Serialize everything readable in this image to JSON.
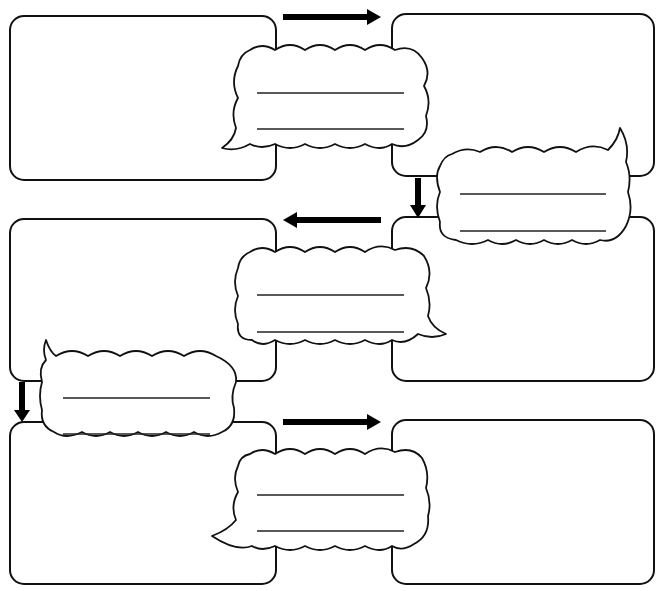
{
  "diagram": {
    "type": "comic-strip-flow-worksheet",
    "background": "#ffffff",
    "stroke_color": "#111111",
    "arrow_color": "#000000",
    "panels": [
      {
        "id": 1,
        "position": "row1-left",
        "content": ""
      },
      {
        "id": 2,
        "position": "row1-right",
        "content": ""
      },
      {
        "id": 3,
        "position": "row2-right",
        "content": ""
      },
      {
        "id": 4,
        "position": "row2-left",
        "content": ""
      },
      {
        "id": 5,
        "position": "row3-left",
        "content": ""
      },
      {
        "id": 6,
        "position": "row3-right",
        "content": ""
      }
    ],
    "speech_bubbles": [
      {
        "id": 1,
        "between": "panel-1 to panel-2",
        "tail": "bottom-left",
        "lines": [
          "",
          ""
        ]
      },
      {
        "id": 2,
        "between": "panel-2 to panel-3",
        "tail": "top-right",
        "lines": [
          "",
          ""
        ]
      },
      {
        "id": 3,
        "between": "panel-3 to panel-4",
        "tail": "bottom-right",
        "lines": [
          "",
          ""
        ]
      },
      {
        "id": 4,
        "between": "panel-4 to panel-5",
        "tail": "top-left",
        "lines": [
          "",
          ""
        ]
      },
      {
        "id": 5,
        "between": "panel-5 to panel-6",
        "tail": "bottom-left",
        "lines": [
          "",
          ""
        ]
      }
    ],
    "arrows": [
      {
        "id": 1,
        "direction": "right",
        "from": "panel-1",
        "to": "panel-2"
      },
      {
        "id": 2,
        "direction": "down",
        "from": "panel-2",
        "to": "panel-3"
      },
      {
        "id": 3,
        "direction": "left",
        "from": "panel-3",
        "to": "panel-4"
      },
      {
        "id": 4,
        "direction": "down",
        "from": "panel-4",
        "to": "panel-5"
      },
      {
        "id": 5,
        "direction": "right",
        "from": "panel-5",
        "to": "panel-6"
      }
    ]
  }
}
